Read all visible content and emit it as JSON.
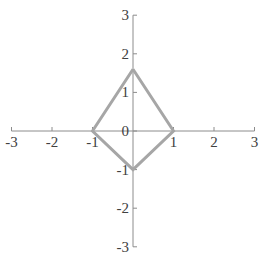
{
  "chart_data": {
    "type": "scatter",
    "title": "",
    "xlabel": "",
    "ylabel": "",
    "xlim": [
      -3,
      3
    ],
    "ylim": [
      -3,
      3
    ],
    "grid": false,
    "legend": null,
    "x_ticks": [
      "-3",
      "-2",
      "-1",
      "0",
      "1",
      "2",
      "3"
    ],
    "y_ticks": [
      "3",
      "2",
      "1",
      "0",
      "-1",
      "-2",
      "-3"
    ],
    "series": [
      {
        "name": "shape",
        "style": "closed polygon (kite), lines only",
        "color": "#a6a6a6",
        "points": [
          {
            "x": 0,
            "y": 1.6
          },
          {
            "x": 1,
            "y": 0
          },
          {
            "x": 0,
            "y": -1
          },
          {
            "x": -1,
            "y": 0
          },
          {
            "x": 0,
            "y": 1.6
          }
        ]
      }
    ]
  },
  "colors": {
    "axis": "#8c8c8c",
    "series": "#a6a6a6",
    "label": "#404040"
  }
}
